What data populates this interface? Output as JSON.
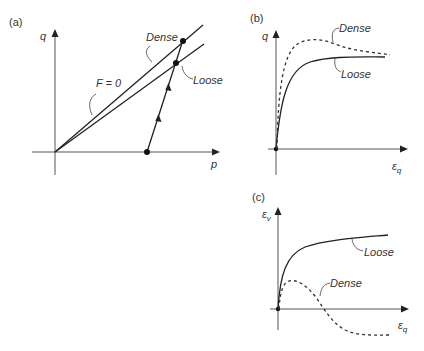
{
  "figure": {
    "panels": [
      {
        "id": "a",
        "tag": "(a)",
        "x_axis_label": "p",
        "y_axis_label": "q",
        "lines": [
          {
            "name": "Dense",
            "label": "Dense",
            "style": "solid"
          },
          {
            "name": "Loose",
            "label": "Loose",
            "style": "solid"
          }
        ],
        "annotation": "F = 0",
        "stress_path": {
          "points": [
            "start on p-axis",
            "Loose",
            "Dense"
          ],
          "arrows": 2
        }
      },
      {
        "id": "b",
        "tag": "(b)",
        "x_axis_label": "ε",
        "x_axis_subscript": "q",
        "y_axis_label": "q",
        "curves": [
          {
            "name": "Dense",
            "label": "Dense",
            "style": "dashed",
            "behavior": "peak then softening"
          },
          {
            "name": "Loose",
            "label": "Loose",
            "style": "solid",
            "behavior": "monotonic hardening to plateau"
          }
        ]
      },
      {
        "id": "c",
        "tag": "(c)",
        "x_axis_label": "ε",
        "x_axis_subscript": "q",
        "y_axis_label": "ε",
        "y_axis_subscript": "v",
        "curves": [
          {
            "name": "Loose",
            "label": "Loose",
            "style": "solid",
            "behavior": "contractive, increasing to plateau"
          },
          {
            "name": "Dense",
            "label": "Dense",
            "style": "dashed",
            "behavior": "initial contraction then dilation"
          }
        ]
      }
    ]
  }
}
